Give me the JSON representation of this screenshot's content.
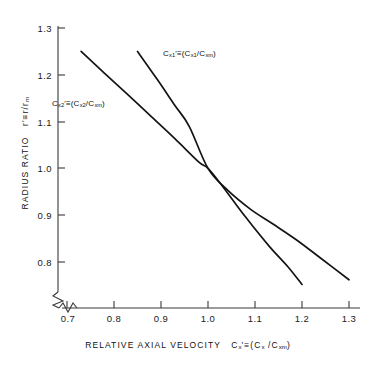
{
  "chart_data": {
    "type": "line",
    "title": "",
    "xlabel": "RELATIVE AXIAL VELOCITY  Cₓ' ≡ (Cₓ / Cₓₘ)",
    "ylabel": "RADIUS RATIO   r' ≡ r/rₘ",
    "xlim": [
      0.7,
      1.3
    ],
    "ylim": [
      0.75,
      1.3
    ],
    "xticks": [
      "0.7",
      "0.8",
      "0.9",
      "1.0",
      "1.1",
      "1.2",
      "1.3"
    ],
    "xtick_values": [
      0.7,
      0.8,
      0.9,
      1.0,
      1.1,
      1.2,
      1.3
    ],
    "yticks": [
      "0.8",
      "0.9",
      "1.0",
      "1.1",
      "1.2",
      "1.3"
    ],
    "ytick_values": [
      0.8,
      0.9,
      1.0,
      1.1,
      1.2,
      1.3
    ],
    "grid": false,
    "axis_break_x": true,
    "axis_break_y": true,
    "legend_position": "inline-annotations",
    "series": [
      {
        "name": "Cx2",
        "label": "Cₓ₂' ≡ (Cₓ₂ / Cₓₘ)",
        "x": [
          0.73,
          0.78,
          0.83,
          0.88,
          0.93,
          0.98,
          1.0,
          1.03,
          1.08,
          1.13,
          1.17,
          1.2
        ],
        "y": [
          1.25,
          1.203,
          1.157,
          1.11,
          1.063,
          1.014,
          1.0,
          0.963,
          0.896,
          0.834,
          0.79,
          0.752
        ]
      },
      {
        "name": "Cx1",
        "label": "Cₓ₁' ≡ (Cₓ₁ / Cₓₘ)",
        "x": [
          0.85,
          0.89,
          0.93,
          0.96,
          1.0,
          1.04,
          1.09,
          1.14,
          1.19,
          1.24,
          1.3
        ],
        "y": [
          1.25,
          1.193,
          1.134,
          1.09,
          1.0,
          0.955,
          0.913,
          0.88,
          0.846,
          0.808,
          0.762
        ]
      }
    ]
  },
  "axes": {
    "x_title_parts": {
      "words": "RELATIVE  AXIAL  VELOCITY",
      "symbol_main": "C",
      "symbol_sub": "x",
      "symbol_prime": "'",
      "equiv": "≡",
      "paren_open": "(C",
      "paren_sub": "x",
      "slash": " /C",
      "paren_sub2": "xm",
      "paren_close": ")"
    },
    "y_title_parts": {
      "words": "RADIUS  RATIO",
      "symbol_main": "r",
      "symbol_prime": "'",
      "equiv": "≡",
      "ratio": "r/r",
      "ratio_sub": "m"
    }
  },
  "annotations": {
    "curve1": {
      "main": "C",
      "sub1": "x1",
      "prime": "'",
      "equiv": "≡",
      "open": "(C",
      "sub2": "x1",
      "slash": "/C",
      "sub3": "xm",
      "close": ")"
    },
    "curve2": {
      "main": "C",
      "sub1": "x2",
      "prime": "'",
      "equiv": "≡",
      "open": "(C",
      "sub2": "x2",
      "slash": "/C",
      "sub3": "xm",
      "close": ")"
    }
  },
  "style": {
    "line_color": "#141414",
    "axis_color": "#3a3a3a",
    "text_color": "#111111",
    "background": "#ffffff"
  }
}
